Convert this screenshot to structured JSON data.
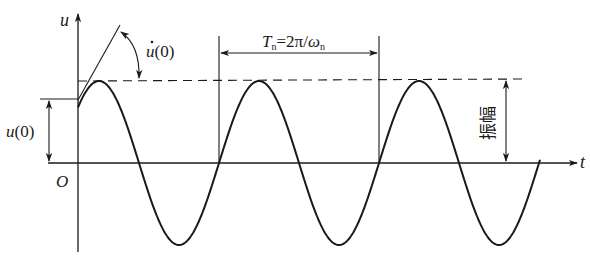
{
  "diagram": {
    "type": "free-vibration-response",
    "axes": {
      "y_label": "u",
      "x_label": "t",
      "origin_label": "O"
    },
    "annotations": {
      "initial_displacement": "u(0)",
      "initial_velocity": "u̇(0)",
      "period_T": "T",
      "period_sub": "n",
      "period_eq": "=2π/",
      "period_omega": "ω",
      "period_omega_sub": "n",
      "amplitude": "振幅"
    },
    "geometry": {
      "axis_y": 163,
      "y_axis_x": 78,
      "amplitude_px": 82,
      "period_px": 160,
      "ascending_zero_x": 59,
      "curve_start_x": 78,
      "curve_end_x": 540,
      "period_lines_x": [
        219,
        379
      ]
    },
    "colors": {
      "ink": "#1a1a1a",
      "background": "#ffffff"
    }
  }
}
